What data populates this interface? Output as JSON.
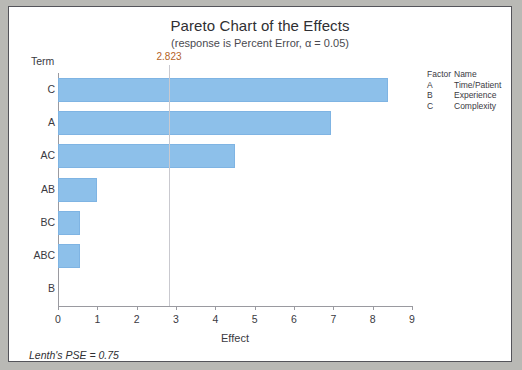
{
  "chart_data": {
    "type": "bar",
    "orientation": "horizontal",
    "title": "Pareto Chart of the Effects",
    "subtitle": "(response is Percent Error, α = 0.05)",
    "xlabel": "Effect",
    "ylabel": "Term",
    "categories": [
      "C",
      "A",
      "AC",
      "AB",
      "BC",
      "ABC",
      "B"
    ],
    "values": [
      8.4,
      6.95,
      4.5,
      1.0,
      0.55,
      0.55,
      0.0
    ],
    "xlim": [
      0,
      9
    ],
    "xticks": [
      "0",
      "1",
      "2",
      "3",
      "4",
      "5",
      "6",
      "7",
      "8",
      "9"
    ],
    "grid": false,
    "reference_line": {
      "value": 2.823,
      "label": "2.823",
      "color": "#b4621f"
    },
    "bar_color": "#8dc0ea",
    "annotation": "Lenth's PSE = 0.75",
    "legend": {
      "position": "right",
      "headers": [
        "Factor",
        "Name"
      ],
      "rows": [
        {
          "factor": "A",
          "name": "Time/Patient"
        },
        {
          "factor": "B",
          "name": "Experience"
        },
        {
          "factor": "C",
          "name": "Complexity"
        }
      ]
    }
  }
}
